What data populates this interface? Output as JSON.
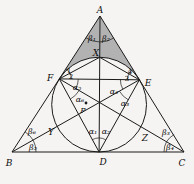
{
  "figure": {
    "background": "#f5f4f2",
    "stroke_color": "#1b1b1b",
    "shade_color": "#b2b2b2",
    "label_color": "#0e0e0e",
    "canvas": {
      "width": 194,
      "height": 184
    },
    "incircle": {
      "cx": 99.1,
      "cy": 104.6,
      "r": 47.4
    },
    "shade_path": "M 100 16 L 59.3 78.9 A 47.4 47.4 0 0 1 139.4 79.8 Z",
    "points": {
      "A": [
        100,
        16
      ],
      "B": [
        12,
        152
      ],
      "C": [
        184,
        152
      ],
      "D": [
        99.1,
        152
      ],
      "E": [
        139.4,
        79.8
      ],
      "F": [
        59.3,
        78.9
      ],
      "X": [
        99.7,
        57.3
      ],
      "Y": [
        57.0,
        126.5
      ],
      "Z": [
        140.9,
        126.8
      ]
    },
    "segments": [
      {
        "name": "side-AB",
        "from": "A",
        "to": "B"
      },
      {
        "name": "side-BC",
        "from": "B",
        "to": "C"
      },
      {
        "name": "side-CA",
        "from": "C",
        "to": "A"
      },
      {
        "name": "cevian-AD",
        "from": "A",
        "to": "D"
      },
      {
        "name": "cevian-BE",
        "from": "B",
        "to": "E"
      },
      {
        "name": "cevian-CF",
        "from": "C",
        "to": "F"
      },
      {
        "name": "chord-FE",
        "from": "F",
        "to": "E"
      },
      {
        "name": "chord-FX",
        "from": "F",
        "to": "X"
      },
      {
        "name": "chord-XE",
        "from": "X",
        "to": "E"
      },
      {
        "name": "chord-FD",
        "from": "F",
        "to": "D"
      },
      {
        "name": "chord-DE",
        "from": "D",
        "to": "E"
      }
    ],
    "angle_arcs": [
      {
        "name": "angle-arc-A",
        "d": "M 85.9 37.8 A 26 26 0 0 0 113.7 38.1"
      },
      {
        "name": "angle-arc-F-upper",
        "d": "M 65.8 68.8 A 12 12 0 0 1 71.3 79.0"
      },
      {
        "name": "angle-arc-E-upper",
        "d": "M 133.1 69.6 A 12 12 0 0 0 127.4 79.7"
      },
      {
        "name": "angle-arc-F-mid",
        "d": "M 78.3 79.1 A 19 19 0 0 1 75.7 88.5"
      },
      {
        "name": "angle-arc-F-lower",
        "d": "M 79.1 90.5 A 23 23 0 0 1 70.3 99.1"
      },
      {
        "name": "angle-arc-E-mid",
        "d": "M 120.4 79.5 A 19 19 0 0 0 122.8 89.1"
      },
      {
        "name": "angle-arc-E-lower",
        "d": "M 119.4 91.1 A 23 23 0 0 0 128.2 99.8"
      },
      {
        "name": "angle-arc-B",
        "d": "M 25.0 131.8 A 24 24 0 0 1 36 152"
      },
      {
        "name": "angle-arc-C",
        "d": "M 174.2 134.5 A 20 20 0 0 0 164 152"
      },
      {
        "name": "angle-arc-D",
        "d": "M 92.3 139.7 A 14 14 0 0 1 105.8 139.8"
      }
    ],
    "marked_point": {
      "id": "P",
      "x": 86,
      "y": 103,
      "r": 1.4
    },
    "labels": [
      {
        "id": "A",
        "text": "A",
        "x": 100,
        "y": 13,
        "size": 9,
        "italic": true
      },
      {
        "id": "B",
        "text": "B",
        "x": 9,
        "y": 166,
        "size": 9,
        "italic": true
      },
      {
        "id": "C",
        "text": "C",
        "x": 182,
        "y": 166,
        "size": 9,
        "italic": true
      },
      {
        "id": "D",
        "text": "D",
        "x": 103,
        "y": 165,
        "size": 9,
        "italic": true
      },
      {
        "id": "E",
        "text": "E",
        "x": 148,
        "y": 86,
        "size": 9,
        "italic": true
      },
      {
        "id": "F",
        "text": "F",
        "x": 50,
        "y": 81,
        "size": 9,
        "italic": true
      },
      {
        "id": "X",
        "text": "X",
        "x": 96,
        "y": 56,
        "size": 9,
        "italic": true
      },
      {
        "id": "Y",
        "text": "Y",
        "x": 51,
        "y": 135,
        "size": 9,
        "italic": true
      },
      {
        "id": "Z",
        "text": "Z",
        "x": 145,
        "y": 141,
        "size": 9,
        "italic": true
      },
      {
        "id": "P",
        "text": "P",
        "x": 83,
        "y": 113,
        "size": 8,
        "italic": true
      },
      {
        "id": "beta1",
        "text": "β₁",
        "x": 92,
        "y": 41,
        "size": 8,
        "italic": true
      },
      {
        "id": "beta2",
        "text": "β₂",
        "x": 106,
        "y": 41,
        "size": 8,
        "italic": true
      },
      {
        "id": "beta3",
        "text": "β₃",
        "x": 166,
        "y": 135,
        "size": 8,
        "italic": true
      },
      {
        "id": "beta4",
        "text": "β₄",
        "x": 170,
        "y": 150,
        "size": 8,
        "italic": true
      },
      {
        "id": "beta5",
        "text": "β₅",
        "x": 33,
        "y": 150,
        "size": 8,
        "italic": true
      },
      {
        "id": "beta6",
        "text": "β₆",
        "x": 32,
        "y": 134,
        "size": 8,
        "italic": true
      },
      {
        "id": "alpha1",
        "text": "α₁",
        "x": 93,
        "y": 134,
        "size": 8,
        "italic": true
      },
      {
        "id": "alpha2",
        "text": "α₂",
        "x": 106,
        "y": 134,
        "size": 8,
        "italic": true
      },
      {
        "id": "alpha3",
        "text": "α₃",
        "x": 125,
        "y": 106,
        "size": 8,
        "italic": true
      },
      {
        "id": "alpha4",
        "text": "α₄",
        "x": 114,
        "y": 94,
        "size": 8,
        "italic": true
      },
      {
        "id": "alpha5",
        "text": "α₅",
        "x": 77,
        "y": 90,
        "size": 8,
        "italic": true
      },
      {
        "id": "alpha6",
        "text": "α₆",
        "x": 80,
        "y": 102,
        "size": 8,
        "italic": true
      },
      {
        "id": "angle1",
        "text": "1",
        "x": 69,
        "y": 73,
        "size": 7,
        "italic": false
      },
      {
        "id": "angle2",
        "text": "2",
        "x": 71,
        "y": 79,
        "size": 7,
        "italic": false
      },
      {
        "id": "angle3",
        "text": "3",
        "x": 127,
        "y": 81,
        "size": 7,
        "italic": false
      },
      {
        "id": "angle4",
        "text": "4",
        "x": 130,
        "y": 74,
        "size": 7,
        "italic": false
      }
    ]
  }
}
